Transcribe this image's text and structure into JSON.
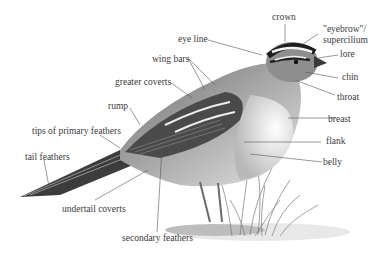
{
  "diagram": {
    "labels": {
      "crown": "crown",
      "eyebrow_line1": "\"eyebrow\"/",
      "eyebrow_line2": "supercilium",
      "lore": "lore",
      "chin": "chin",
      "throat": "throat",
      "breast": "breast",
      "flank": "flank",
      "belly": "belly",
      "eye_line": "eye line",
      "wing_bars": "wing bars",
      "greater_coverts": "greater coverts",
      "rump": "rump",
      "tips_of_primary_feathers": "tips of primary feathers",
      "tail_feathers": "tail feathers",
      "undertail_coverts": "undertail coverts",
      "secondary_feathers": "secondary feathers"
    },
    "colors": {
      "label_text": "#3a3a3a",
      "leader_line": "#555555",
      "bird_dark": "#2a2a2a",
      "bird_mid": "#8a8a8a",
      "bird_light": "#d8d8d8"
    }
  }
}
